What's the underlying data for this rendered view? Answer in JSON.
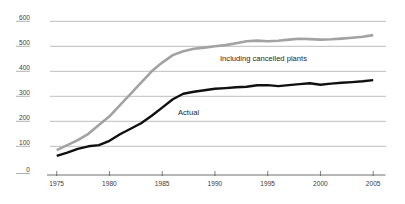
{
  "chart_data": {
    "type": "line",
    "title": "",
    "xlabel": "",
    "ylabel": "",
    "grid": true,
    "legend_position": "inline-annotations",
    "xlim": [
      1975,
      2005
    ],
    "ylim": [
      0,
      600
    ],
    "yticks": [
      600,
      500,
      400,
      300,
      200,
      100,
      0
    ],
    "xticks": [
      1975,
      1980,
      1985,
      1990,
      1995,
      2000,
      2005
    ],
    "x": [
      1975,
      1976,
      1977,
      1978,
      1979,
      1980,
      1981,
      1982,
      1983,
      1984,
      1985,
      1986,
      1987,
      1988,
      1989,
      1990,
      1991,
      1992,
      1993,
      1994,
      1995,
      1996,
      1997,
      1998,
      1999,
      2000,
      2001,
      2002,
      2003,
      2004,
      2005
    ],
    "series": [
      {
        "name": "Including cancelled plants",
        "color": "#a2a2a2",
        "stroke_width": 2.6,
        "values": [
          85,
          105,
          125,
          150,
          185,
          220,
          265,
          310,
          355,
          400,
          435,
          465,
          480,
          490,
          495,
          500,
          505,
          512,
          520,
          523,
          520,
          522,
          527,
          530,
          529,
          527,
          528,
          531,
          534,
          538,
          545
        ]
      },
      {
        "name": "Actual",
        "color": "#101010",
        "stroke_width": 2.4,
        "values": [
          62,
          75,
          90,
          100,
          105,
          122,
          148,
          170,
          192,
          222,
          255,
          288,
          310,
          318,
          324,
          330,
          333,
          336,
          338,
          344,
          345,
          341,
          345,
          349,
          352,
          346,
          351,
          354,
          357,
          360,
          365
        ]
      }
    ],
    "annotations": [
      {
        "text": "Including cancelled plants",
        "px": [
          220,
          61
        ]
      },
      {
        "text": "Actual",
        "px": [
          178,
          115
        ]
      }
    ],
    "colors": {
      "gridline": "#8f8f8f",
      "axis": "#4a4a4a",
      "tick_label": "#3c3c3c",
      "background": "#ffffff"
    }
  }
}
